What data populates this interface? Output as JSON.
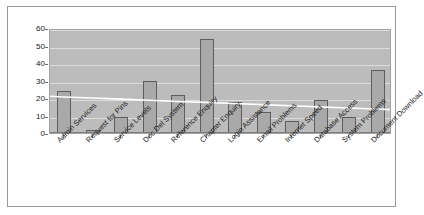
{
  "chart_data": {
    "type": "bar",
    "title": "",
    "xlabel": "",
    "ylabel": "",
    "ylim": [
      0,
      60
    ],
    "yticks": [
      0,
      10,
      20,
      30,
      40,
      50,
      60
    ],
    "grid": true,
    "legend": "none",
    "categories": [
      "Admin Services",
      "Request for Pins",
      "Service Levels",
      "Doc Del System",
      "Reference Enquiry",
      "Chapter Enquiry",
      "Login Assistance",
      "Email Problems",
      "Internet Speed",
      "Database Access",
      "System Problems",
      "Document Download"
    ],
    "values": [
      24,
      2,
      9,
      30,
      22,
      54,
      18,
      12,
      7,
      19,
      9,
      36
    ],
    "series": [
      {
        "name": "Enquiries",
        "type": "bar",
        "values": [
          24,
          2,
          9,
          30,
          22,
          54,
          18,
          12,
          7,
          19,
          9,
          36
        ]
      },
      {
        "name": "Linear trend",
        "type": "line",
        "values": [
          21,
          20.4,
          19.7,
          19.1,
          18.4,
          17.8,
          17.2,
          16.5,
          15.9,
          15.2,
          14.6,
          14
        ]
      }
    ]
  },
  "style": {
    "plot_background": "#bcbcbc",
    "bar_fill": "#a9a9a9",
    "bar_border": "#5d5d5d",
    "gridline_color": "#dcdcdc",
    "trendline_color": "#ffffff",
    "frame_border": "#9a9a9a",
    "text_color": "#1a1a1a"
  }
}
